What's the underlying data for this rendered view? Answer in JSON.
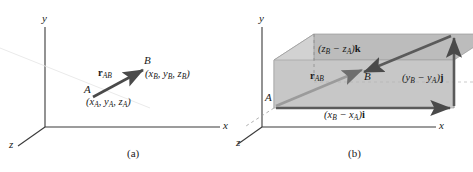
{
  "figure": {
    "panels": [
      {
        "id": "a",
        "caption": "(a)",
        "axes": {
          "x": "x",
          "y": "y",
          "z": "z"
        },
        "points": [
          {
            "name": "A",
            "label": "A",
            "coords": "(x",
            "coords_full": "(xA, yA, zA)"
          },
          {
            "name": "B",
            "label": "B",
            "coords_full": "(xB, yB, zB)"
          }
        ],
        "point_a_label": "A",
        "point_b_label": "B",
        "coord_a": {
          "open": "(",
          "x": "x",
          "xs": "A",
          "c1": ", ",
          "y": "y",
          "ys": "A",
          "c2": ", ",
          "z": "z",
          "zs": "A",
          "close": ")"
        },
        "coord_b": {
          "open": "(",
          "x": "x",
          "xs": "B",
          "c1": ", ",
          "y": "y",
          "ys": "B",
          "c2": ", ",
          "z": "z",
          "zs": "B",
          "close": ")"
        },
        "vector": {
          "symbol": "r",
          "subscript": "AB"
        }
      },
      {
        "id": "b",
        "caption": "(b)",
        "axes": {
          "x": "x",
          "y": "y",
          "z": "z"
        },
        "point_a_label": "A",
        "point_b_label": "B",
        "vector": {
          "symbol": "r",
          "subscript": "AB"
        },
        "components": {
          "i": {
            "open": "(",
            "v1": "x",
            "s1": "B",
            "minus": " − ",
            "v2": "x",
            "s2": "A",
            "close": ")",
            "unit": "i"
          },
          "j": {
            "open": "(",
            "v1": "y",
            "s1": "B",
            "minus": " − ",
            "v2": "y",
            "s2": "A",
            "close": ")",
            "unit": "j"
          },
          "k": {
            "open": "(",
            "v1": "z",
            "s1": "B",
            "minus": " − ",
            "v2": "z",
            "s2": "A",
            "close": ")",
            "unit": "k"
          }
        }
      }
    ],
    "colors": {
      "axis": "#3a3a3a",
      "vector": "#4a4a4a",
      "box_front": "#c9c9c9",
      "box_top": "#bdbdbd",
      "box_side": "#d6d6d6",
      "background": "#ffffff",
      "text": "#1a1a1a"
    }
  }
}
